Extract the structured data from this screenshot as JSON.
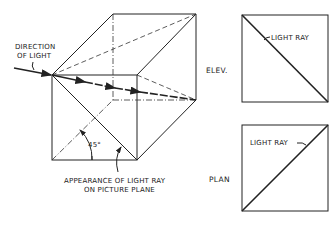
{
  "labels": {
    "direction_line1": "DIRECTION",
    "direction_line2": "OF LIGHT",
    "angle": "45°",
    "appearance_line1": "APPEARANCE OF LIGHT RAY",
    "appearance_line2": "ON PICTURE PLANE",
    "elevation_view": "ELEV.",
    "plan_view": "PLAN",
    "elev_light_ray": "LIGHT RAY",
    "plan_light_ray": "LIGHT RAY"
  },
  "colors": {
    "line": "#222222",
    "background": "#ffffff"
  }
}
